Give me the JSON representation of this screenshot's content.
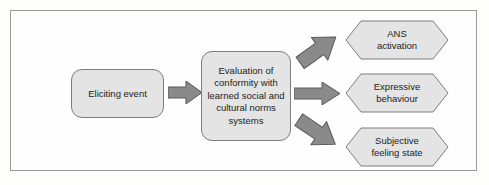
{
  "diagram": {
    "colors": {
      "frame_border": "#9a9a9a",
      "node_fill": "#e4e4e4",
      "node_border": "#7d7d7d",
      "arrow_fill": "#8a8a8a",
      "arrow_border": "#5a5a5a",
      "text": "#1c1c1c",
      "background": "#fdfdfc"
    },
    "nodes": [
      {
        "id": "eliciting-event",
        "shape": "rounded-rectangle",
        "label": "Eliciting event"
      },
      {
        "id": "evaluation",
        "shape": "rounded-rectangle",
        "label": "Evaluation of conformity with learned social and cultural norms systems"
      },
      {
        "id": "ans-activation",
        "shape": "hexagon",
        "label": "ANS\nactivation"
      },
      {
        "id": "expressive-behaviour",
        "shape": "hexagon",
        "label": "Expressive\nbehaviour"
      },
      {
        "id": "subjective-feeling-state",
        "shape": "hexagon",
        "label": "Subjective\nfeeling state"
      }
    ],
    "arrows": [
      {
        "id": "main",
        "from": "eliciting-event",
        "to": "evaluation",
        "direction": "right"
      },
      {
        "id": "to-ans",
        "from": "evaluation",
        "to": "ans-activation",
        "direction": "up-right"
      },
      {
        "id": "to-expressive",
        "from": "evaluation",
        "to": "expressive-behaviour",
        "direction": "right"
      },
      {
        "id": "to-subjective",
        "from": "evaluation",
        "to": "subjective-feeling-state",
        "direction": "down-right"
      }
    ]
  }
}
